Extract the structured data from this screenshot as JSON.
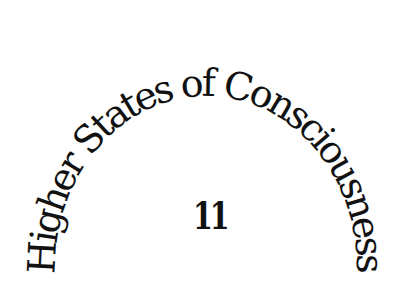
{
  "title": {
    "text": "Higher States of Consciousness"
  },
  "number": {
    "value": "11"
  },
  "colors": {
    "background": "#ffffff",
    "text": "#111111"
  }
}
